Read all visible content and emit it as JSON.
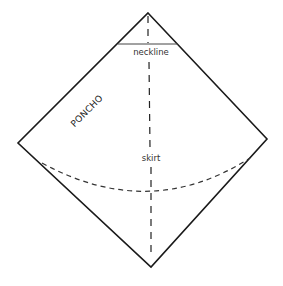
{
  "diagram": {
    "title": "PONCHO",
    "labels": {
      "neckline": "neckline",
      "skirt": "skirt"
    },
    "elements": {
      "outline": "diamond-shaped garment outline",
      "neckline": "solid horizontal line near top vertex",
      "center_fold": "dashed vertical line from top to bottom vertex",
      "skirt_hem": "dashed curved line across lower half"
    },
    "colors": {
      "line": "#1a1a1a",
      "text": "#333333",
      "background": "#ffffff"
    }
  }
}
